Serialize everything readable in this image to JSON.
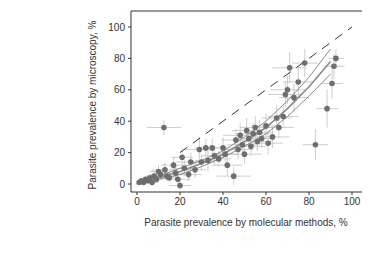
{
  "chart_data": {
    "type": "scatter",
    "title": "",
    "xlabel": "Parasite prevalence by molecular methods, %",
    "ylabel": "Parasite prevalence by microscopy, %",
    "xlim": [
      -3,
      105
    ],
    "ylim": [
      -5,
      110
    ],
    "xticks": [
      0,
      20,
      40,
      60,
      80,
      100
    ],
    "yticks": [
      0,
      20,
      40,
      60,
      80,
      100
    ],
    "grid": false,
    "legend": null,
    "reference_line": {
      "type": "identity",
      "style": "dashed",
      "x": [
        20,
        100
      ],
      "y": [
        20,
        100
      ]
    },
    "fit_curve": {
      "x": [
        0,
        10,
        20,
        30,
        40,
        50,
        60,
        70,
        80,
        90
      ],
      "y": [
        1,
        4,
        8,
        13,
        19,
        27,
        36,
        48,
        62,
        78
      ],
      "ci_lower": [
        0,
        3,
        6,
        11,
        17,
        24,
        32,
        43,
        56,
        70
      ],
      "ci_upper": [
        2,
        5,
        10,
        15,
        21,
        30,
        40,
        53,
        68,
        86
      ]
    },
    "points": [
      {
        "x": 1,
        "y": 1,
        "xerr": 1,
        "yerr": 1
      },
      {
        "x": 2,
        "y": 2,
        "xerr": 1,
        "yerr": 1
      },
      {
        "x": 3,
        "y": 1,
        "xerr": 2,
        "yerr": 1
      },
      {
        "x": 4,
        "y": 3,
        "xerr": 2,
        "yerr": 2
      },
      {
        "x": 5,
        "y": 2,
        "xerr": 2,
        "yerr": 1
      },
      {
        "x": 6,
        "y": 4,
        "xerr": 3,
        "yerr": 2
      },
      {
        "x": 7,
        "y": 1,
        "xerr": 3,
        "yerr": 2
      },
      {
        "x": 8,
        "y": 5,
        "xerr": 4,
        "yerr": 3
      },
      {
        "x": 9,
        "y": 3,
        "xerr": 3,
        "yerr": 2
      },
      {
        "x": 10,
        "y": 8,
        "xerr": 4,
        "yerr": 4
      },
      {
        "x": 11,
        "y": 6,
        "xerr": 5,
        "yerr": 3
      },
      {
        "x": 12.5,
        "y": 36,
        "xerr": 8,
        "yerr": 5
      },
      {
        "x": 13,
        "y": 9,
        "xerr": 6,
        "yerr": 5
      },
      {
        "x": 14,
        "y": 5,
        "xerr": 5,
        "yerr": 3
      },
      {
        "x": 15,
        "y": 4,
        "xerr": 4,
        "yerr": 3
      },
      {
        "x": 17,
        "y": 12,
        "xerr": 6,
        "yerr": 5
      },
      {
        "x": 18,
        "y": 7,
        "xerr": 5,
        "yerr": 4
      },
      {
        "x": 19,
        "y": 3,
        "xerr": 6,
        "yerr": 3
      },
      {
        "x": 20,
        "y": -1,
        "xerr": 5,
        "yerr": 3
      },
      {
        "x": 21,
        "y": 17,
        "xerr": 5,
        "yerr": 6
      },
      {
        "x": 22,
        "y": 10,
        "xerr": 6,
        "yerr": 5
      },
      {
        "x": 24,
        "y": 6,
        "xerr": 6,
        "yerr": 4
      },
      {
        "x": 25,
        "y": 14,
        "xerr": 7,
        "yerr": 6
      },
      {
        "x": 27,
        "y": 9,
        "xerr": 5,
        "yerr": 5
      },
      {
        "x": 29,
        "y": 22,
        "xerr": 7,
        "yerr": 8
      },
      {
        "x": 30,
        "y": 14,
        "xerr": 6,
        "yerr": 5
      },
      {
        "x": 32,
        "y": 23,
        "xerr": 5,
        "yerr": 6
      },
      {
        "x": 33,
        "y": 15,
        "xerr": 6,
        "yerr": 7
      },
      {
        "x": 35,
        "y": 23,
        "xerr": 6,
        "yerr": 6
      },
      {
        "x": 36,
        "y": 18,
        "xerr": 6,
        "yerr": 6
      },
      {
        "x": 38,
        "y": 16,
        "xerr": 6,
        "yerr": 5
      },
      {
        "x": 40,
        "y": 23,
        "xerr": 7,
        "yerr": 7
      },
      {
        "x": 41,
        "y": 19,
        "xerr": 6,
        "yerr": 5
      },
      {
        "x": 42,
        "y": 12,
        "xerr": 7,
        "yerr": 7
      },
      {
        "x": 45,
        "y": 5,
        "xerr": 8,
        "yerr": 6
      },
      {
        "x": 46,
        "y": 28,
        "xerr": 7,
        "yerr": 7
      },
      {
        "x": 47,
        "y": 22,
        "xerr": 7,
        "yerr": 6
      },
      {
        "x": 48,
        "y": 31,
        "xerr": 8,
        "yerr": 8
      },
      {
        "x": 49,
        "y": 25,
        "xerr": 7,
        "yerr": 7
      },
      {
        "x": 50,
        "y": 19,
        "xerr": 8,
        "yerr": 6
      },
      {
        "x": 51,
        "y": 34,
        "xerr": 7,
        "yerr": 8
      },
      {
        "x": 52,
        "y": 29,
        "xerr": 6,
        "yerr": 7
      },
      {
        "x": 53,
        "y": 24,
        "xerr": 7,
        "yerr": 6
      },
      {
        "x": 54,
        "y": 32,
        "xerr": 8,
        "yerr": 7
      },
      {
        "x": 55,
        "y": 36,
        "xerr": 7,
        "yerr": 7
      },
      {
        "x": 56,
        "y": 27,
        "xerr": 7,
        "yerr": 6
      },
      {
        "x": 57,
        "y": 33,
        "xerr": 7,
        "yerr": 8
      },
      {
        "x": 58,
        "y": 29,
        "xerr": 6,
        "yerr": 6
      },
      {
        "x": 60,
        "y": 37,
        "xerr": 7,
        "yerr": 8
      },
      {
        "x": 61,
        "y": 26,
        "xerr": 7,
        "yerr": 7
      },
      {
        "x": 63,
        "y": 30,
        "xerr": 8,
        "yerr": 7
      },
      {
        "x": 65,
        "y": 42,
        "xerr": 7,
        "yerr": 8
      },
      {
        "x": 66,
        "y": 36,
        "xerr": 7,
        "yerr": 7
      },
      {
        "x": 68,
        "y": 43,
        "xerr": 7,
        "yerr": 7
      },
      {
        "x": 69,
        "y": 57,
        "xerr": 8,
        "yerr": 8
      },
      {
        "x": 70,
        "y": 60,
        "xerr": 8,
        "yerr": 9
      },
      {
        "x": 71,
        "y": 74,
        "xerr": 8,
        "yerr": 10
      },
      {
        "x": 73,
        "y": 55,
        "xerr": 7,
        "yerr": 9
      },
      {
        "x": 75,
        "y": 65,
        "xerr": 7,
        "yerr": 10
      },
      {
        "x": 78,
        "y": 77,
        "xerr": 6,
        "yerr": 9
      },
      {
        "x": 83,
        "y": 25,
        "xerr": 6,
        "yerr": 10
      },
      {
        "x": 88.4,
        "y": 48,
        "xerr": 5,
        "yerr": 12
      },
      {
        "x": 90.7,
        "y": 64,
        "xerr": 5,
        "yerr": 10
      },
      {
        "x": 91.6,
        "y": 75,
        "xerr": 5,
        "yerr": 8
      },
      {
        "x": 92.5,
        "y": 80,
        "xerr": 4,
        "yerr": 6
      }
    ]
  },
  "axes": {
    "x_tick_labels": [
      "0",
      "20",
      "40",
      "60",
      "80",
      "100"
    ],
    "y_tick_labels": [
      "0",
      "20",
      "40",
      "60",
      "80",
      "100"
    ],
    "xlabel": "Parasite prevalence by molecular methods, %",
    "ylabel": "Parasite prevalence by microscopy, %"
  },
  "colors": {
    "point": "#6e6e6e",
    "errorbar": "#c2c2c2",
    "fit_line": "#8a8a8a",
    "reference_line": "#333333",
    "axis": "#333333"
  }
}
